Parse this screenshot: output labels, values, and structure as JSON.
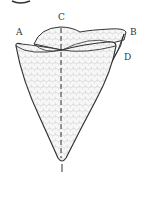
{
  "figure": {
    "partial_glyph": "g",
    "labels": [
      {
        "id": "A",
        "text": "A",
        "x": 16,
        "y": 28
      },
      {
        "id": "B",
        "text": "B",
        "x": 130,
        "y": 28
      },
      {
        "id": "C",
        "text": "C",
        "x": 58,
        "y": 13
      },
      {
        "id": "D",
        "text": "D",
        "x": 124,
        "y": 53
      }
    ],
    "colors": {
      "stroke": "#333333",
      "fill": "#f2f2f2",
      "background": "#ffffff"
    }
  }
}
